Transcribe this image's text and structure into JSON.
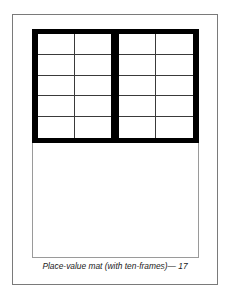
{
  "document": {
    "caption": "Place-value mat (with ten-frames)— 17",
    "mat": {
      "ten_frames": [
        {
          "label": "left-ten-frame",
          "columns": 2,
          "rows": 5
        },
        {
          "label": "right-ten-frame",
          "columns": 2,
          "rows": 5
        }
      ],
      "colors": {
        "frame_border": "#000000",
        "grid_line": "#3a3a3a",
        "outer_border": "#7a7a7a",
        "lower_area_border": "#9a9a9a"
      }
    }
  }
}
